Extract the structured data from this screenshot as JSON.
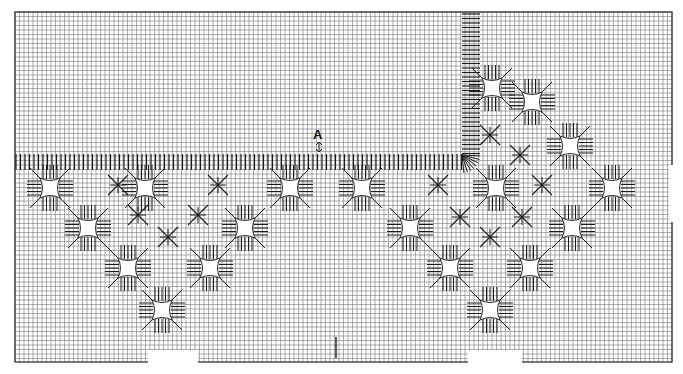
{
  "diagram": {
    "type": "needlepoint stitch chart",
    "width": 683,
    "height": 374,
    "grid": {
      "x0": 15,
      "y0": 12,
      "x1": 672,
      "y1": 362,
      "cell": 4.5,
      "line_color": "#8a8a8a",
      "border_color": "#333333",
      "bottom_gaps": [
        [
          148,
          198
        ],
        [
          468,
          522
        ]
      ],
      "right_gap": [
        165,
        222
      ]
    },
    "marker": {
      "label": "A",
      "x": 313,
      "y": 136,
      "arrow": "up-down"
    },
    "bottom_tick": {
      "x": 336,
      "y0": 337,
      "y1": 358
    },
    "stitch_color": "#1a1a1a",
    "horizontal_band": {
      "x0": 15,
      "x1": 462,
      "y0": 154,
      "y1": 170
    },
    "vertical_band": {
      "x0": 462,
      "x1": 480,
      "y0": 12,
      "y1": 170
    },
    "fan_corner": {
      "x": 462,
      "y": 155
    },
    "eyelets": [
      [
        50,
        188
      ],
      [
        145,
        188
      ],
      [
        290,
        188
      ],
      [
        88,
        228
      ],
      [
        245,
        228
      ],
      [
        128,
        268
      ],
      [
        210,
        268
      ],
      [
        162,
        310
      ],
      [
        362,
        188
      ],
      [
        496,
        188
      ],
      [
        612,
        188
      ],
      [
        410,
        228
      ],
      [
        572,
        228
      ],
      [
        450,
        268
      ],
      [
        530,
        268
      ],
      [
        490,
        310
      ],
      [
        492,
        88
      ],
      [
        532,
        102
      ],
      [
        570,
        146
      ]
    ],
    "stars": [
      [
        118,
        185
      ],
      [
        218,
        185
      ],
      [
        138,
        215
      ],
      [
        198,
        215
      ],
      [
        168,
        237
      ],
      [
        438,
        185
      ],
      [
        542,
        185
      ],
      [
        460,
        217
      ],
      [
        522,
        217
      ],
      [
        490,
        237
      ],
      [
        490,
        135
      ],
      [
        520,
        155
      ]
    ]
  }
}
